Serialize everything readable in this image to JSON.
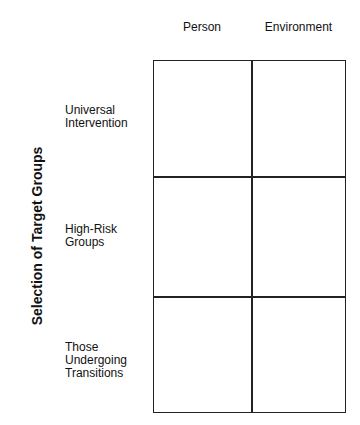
{
  "columns": [
    {
      "label": "Person"
    },
    {
      "label": "Environment"
    }
  ],
  "axis_title": "Selection of Target Groups",
  "rows": [
    {
      "label": "Universal Intervention"
    },
    {
      "label": "High-Risk Groups"
    },
    {
      "label": "Those Undergoing Transitions"
    }
  ]
}
